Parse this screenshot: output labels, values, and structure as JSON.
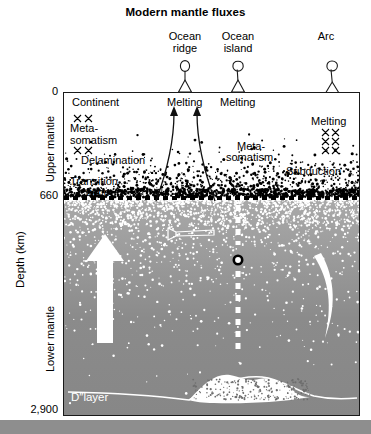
{
  "figure": {
    "title": "Modern mantle fluxes",
    "type": "cross-section-diagram"
  },
  "axis": {
    "title": "Depth (km)",
    "ticks": [
      {
        "label": "0",
        "depth_km": 0
      },
      {
        "label": "660",
        "depth_km": 660
      },
      {
        "label": "2,900",
        "depth_km": 2900
      }
    ],
    "layers": [
      {
        "name": "Upper mantle",
        "top_km": 0,
        "bottom_km": 660
      },
      {
        "name": "Lower mantle",
        "top_km": 660,
        "bottom_km": 2900
      }
    ]
  },
  "surface_features": [
    {
      "id": "ocean-ridge",
      "label_line1": "Ocean",
      "label_line2": "ridge",
      "icon": "balloon-on-triangle-icon"
    },
    {
      "id": "ocean-island",
      "label_line1": "Ocean",
      "label_line2": "island",
      "icon": "balloon-on-triangle-icon"
    },
    {
      "id": "arc",
      "label_line1": "Arc",
      "label_line2": "",
      "icon": "balloon-on-wedge-icon"
    }
  ],
  "annotations": {
    "continent": "Continent",
    "metasomatism_left_line1": "Meta-",
    "metasomatism_left_line2": "somatism",
    "delamination": "Delamination",
    "transition_zone_line1": "Transition",
    "transition_zone_line2": "zone",
    "melting_ridge": "Melting",
    "melting_island": "Melting",
    "melting_arc": "Melting",
    "metasomatism_right_line1": "Meta-",
    "metasomatism_right_line2": "somatism",
    "subduction": "Subduction",
    "d_layer": "D″layer"
  },
  "flux_elements": [
    {
      "id": "upwelling-plume-arrow",
      "style": "white-solid-arrow-up"
    },
    {
      "id": "lower-mantle-flow-arrow",
      "style": "white-outline-arrow-left"
    },
    {
      "id": "dashed-plume-conduit",
      "style": "white-dashed-vertical"
    },
    {
      "id": "plume-source-marker",
      "style": "black-ring-circle"
    },
    {
      "id": "subducting-slab",
      "style": "white-curved-band"
    },
    {
      "id": "ridge-melting-arrow-left",
      "style": "black-curved-arrow-up"
    },
    {
      "id": "ridge-melting-arrow-right",
      "style": "black-curved-arrow-up"
    },
    {
      "id": "d-double-prime-pile",
      "style": "white-speckled-mound"
    }
  ],
  "colors": {
    "upper_mantle_fill": "#ffffff",
    "lower_mantle_fill": "#8e8e8e",
    "lower_mantle_top": "#a9a9a9",
    "boundary_660": "#000000",
    "speckle_upper": "#000000",
    "speckle_lower": "#ffffff",
    "frame": "#1a1a1a"
  }
}
